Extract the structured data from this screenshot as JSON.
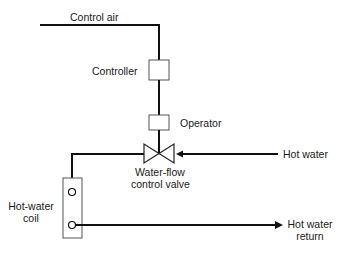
{
  "diagram": {
    "labels": {
      "control_air": "Control air",
      "controller": "Controller",
      "operator": "Operator",
      "hot_water": "Hot water",
      "valve_line1": "Water-flow",
      "valve_line2": "control valve",
      "coil_line1": "Hot-water",
      "coil_line2": "coil",
      "return_line1": "Hot water",
      "return_line2": "return"
    },
    "colors": {
      "line": "#111111",
      "box": "#555555",
      "background": "#ffffff"
    }
  }
}
